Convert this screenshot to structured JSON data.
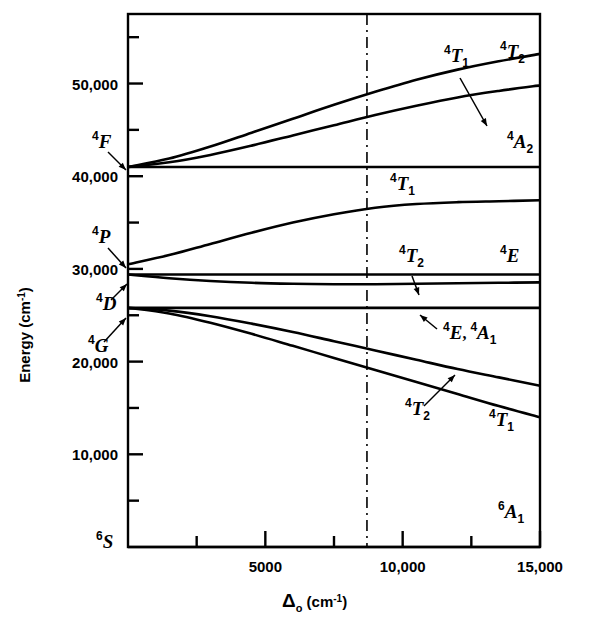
{
  "figure": {
    "kind": "energy-level-diagram",
    "background_color": "#ffffff",
    "line_color": "#000000"
  },
  "axes": {
    "x_label_main": "Δ",
    "x_label_sub": "o",
    "x_label_unit": "(cm",
    "x_label_unit_sup": "-1",
    "x_label_unit_close": ")",
    "y_label_main": "Energy",
    "y_label_unit": "(cm",
    "y_label_unit_sup": "-1",
    "y_label_unit_close": ")",
    "x_ticks_major": [
      "5000",
      "10,000",
      "15,000"
    ],
    "x_tick_values_major": [
      5000,
      10000,
      15000
    ],
    "x_tick_values_minor": [
      2500,
      7500,
      12500
    ],
    "y_ticks_major": [
      "10,000",
      "20,000",
      "30,000",
      "40,000",
      "50,000"
    ],
    "y_tick_values_major": [
      10000,
      20000,
      30000,
      40000,
      50000
    ],
    "y_tick_values_minor": [
      5000,
      15000,
      25000,
      35000,
      45000,
      55000
    ],
    "xlim": [
      0,
      15000
    ],
    "ylim": [
      0,
      57500
    ],
    "marker_line_x": 8700,
    "marker_line_style": "dash-dot"
  },
  "free_ion_terms": [
    {
      "name": "four-F",
      "sup": "4",
      "letter": "F",
      "energy": 41000,
      "label_x": 92,
      "label_y": 148,
      "arrow_from": [
        108,
        152
      ],
      "arrow_to": [
        126,
        170
      ]
    },
    {
      "name": "four-P",
      "sup": "4",
      "letter": "P",
      "energy": 30500,
      "label_x": 92,
      "label_y": 243,
      "arrow_from": [
        108,
        248
      ],
      "arrow_to": [
        126,
        268
      ]
    },
    {
      "name": "four-D",
      "sup": "4",
      "letter": "D",
      "energy": 29300,
      "label_x": 96,
      "label_y": 310,
      "arrow_from": [
        111,
        300
      ],
      "arrow_to": [
        127,
        284
      ]
    },
    {
      "name": "four-G",
      "sup": "4",
      "letter": "G",
      "energy": 25800,
      "label_x": 88,
      "label_y": 352,
      "arrow_from": [
        104,
        342
      ],
      "arrow_to": [
        126,
        318
      ]
    },
    {
      "name": "six-S",
      "sup": "6",
      "letter": "S",
      "energy": 0,
      "label_x": 96,
      "label_y": 548,
      "arrow_from": null,
      "arrow_to": null
    }
  ],
  "chart_data": {
    "type": "line",
    "title": "",
    "xlabel": "Δo (cm-1)",
    "ylabel": "Energy (cm-1)",
    "xlim": [
      0,
      15000
    ],
    "ylim": [
      0,
      57500
    ],
    "grid": false,
    "legend": "inline-labels",
    "x_unit": "cm-1",
    "y_unit": "cm-1",
    "series": [
      {
        "name": "4T2 (from 4F)",
        "label_sup": "4",
        "label_letter": "T",
        "label_sub": "2",
        "points": [
          [
            0,
            41000
          ],
          [
            1500,
            41900
          ],
          [
            3000,
            43200
          ],
          [
            4500,
            44700
          ],
          [
            6000,
            46200
          ],
          [
            7500,
            47700
          ],
          [
            9000,
            49100
          ],
          [
            10500,
            50400
          ],
          [
            12000,
            51500
          ],
          [
            13500,
            52400
          ],
          [
            15000,
            53200
          ]
        ]
      },
      {
        "name": "4A2 (from 4F)",
        "label_sup": "4",
        "label_letter": "A",
        "label_sub": "2",
        "points": [
          [
            0,
            41000
          ],
          [
            1500,
            41500
          ],
          [
            3000,
            42300
          ],
          [
            4500,
            43300
          ],
          [
            6000,
            44400
          ],
          [
            7500,
            45500
          ],
          [
            9000,
            46600
          ],
          [
            10500,
            47600
          ],
          [
            12000,
            48500
          ],
          [
            13500,
            49200
          ],
          [
            15000,
            49800
          ]
        ]
      },
      {
        "name": "4T1 (from 4F)",
        "label_sup": "4",
        "label_letter": "T",
        "label_sub": "1",
        "points": [
          [
            0,
            41000
          ],
          [
            2000,
            41000
          ],
          [
            5000,
            41000
          ],
          [
            9000,
            41000
          ],
          [
            12000,
            41000
          ],
          [
            15000,
            41000
          ]
        ]
      },
      {
        "name": "4T1 (from 4P)",
        "label_sup": "4",
        "label_letter": "T",
        "label_sub": "1",
        "points": [
          [
            0,
            30500
          ],
          [
            1500,
            31500
          ],
          [
            3000,
            32700
          ],
          [
            4500,
            33900
          ],
          [
            6000,
            35000
          ],
          [
            7500,
            35900
          ],
          [
            9000,
            36600
          ],
          [
            10500,
            37000
          ],
          [
            12000,
            37200
          ],
          [
            13500,
            37300
          ],
          [
            15000,
            37400
          ]
        ]
      },
      {
        "name": "4E (from 4D)",
        "label_sup": "4",
        "label_letter": "E",
        "label_sub": "",
        "points": [
          [
            0,
            29400
          ],
          [
            3000,
            29400
          ],
          [
            7000,
            29400
          ],
          [
            11000,
            29400
          ],
          [
            15000,
            29400
          ]
        ]
      },
      {
        "name": "4T2 (from 4D)",
        "label_sup": "4",
        "label_letter": "T",
        "label_sub": "2",
        "points": [
          [
            0,
            29400
          ],
          [
            1500,
            29000
          ],
          [
            3000,
            28700
          ],
          [
            4500,
            28500
          ],
          [
            6000,
            28400
          ],
          [
            7500,
            28350
          ],
          [
            9000,
            28350
          ],
          [
            10500,
            28400
          ],
          [
            12000,
            28450
          ],
          [
            13500,
            28500
          ],
          [
            15000,
            28550
          ]
        ]
      },
      {
        "name": "4E 4A1 (from 4G)",
        "label_sup": "4",
        "label_letter": "E",
        "label_sub": "",
        "label2_sup": "4",
        "label2_letter": "A",
        "label2_sub": "1",
        "label_separator": ",",
        "points": [
          [
            0,
            25800
          ],
          [
            3000,
            25800
          ],
          [
            7000,
            25800
          ],
          [
            11000,
            25800
          ],
          [
            15000,
            25800
          ]
        ]
      },
      {
        "name": "4T2 (from 4G)",
        "label_sup": "4",
        "label_letter": "T",
        "label_sub": "2",
        "points": [
          [
            0,
            25800
          ],
          [
            1500,
            25500
          ],
          [
            3000,
            24900
          ],
          [
            4500,
            24100
          ],
          [
            6000,
            23200
          ],
          [
            7500,
            22200
          ],
          [
            9000,
            21200
          ],
          [
            10500,
            20200
          ],
          [
            12000,
            19200
          ],
          [
            13500,
            18300
          ],
          [
            15000,
            17400
          ]
        ]
      },
      {
        "name": "4T1 (from 4G)",
        "label_sup": "4",
        "label_letter": "T",
        "label_sub": "1",
        "points": [
          [
            0,
            25800
          ],
          [
            1500,
            25200
          ],
          [
            3000,
            24200
          ],
          [
            4500,
            23000
          ],
          [
            6000,
            21700
          ],
          [
            7500,
            20400
          ],
          [
            9000,
            19100
          ],
          [
            10500,
            17800
          ],
          [
            12000,
            16500
          ],
          [
            13500,
            15200
          ],
          [
            15000,
            14000
          ]
        ]
      },
      {
        "name": "6A1 (ground)",
        "label_sup": "6",
        "label_letter": "A",
        "label_sub": "1",
        "points": [
          [
            0,
            0
          ],
          [
            5000,
            0
          ],
          [
            10000,
            0
          ],
          [
            15000,
            0
          ]
        ]
      }
    ]
  },
  "curve_labels": [
    {
      "name": "label-4T2-upper",
      "sup": "4",
      "letter": "T",
      "sub": "2",
      "x": 500,
      "y": 58,
      "arrow": null
    },
    {
      "name": "label-4T1-upper",
      "sup": "4",
      "letter": "T",
      "sub": "1",
      "x": 444,
      "y": 62,
      "arrow": {
        "from": [
          460,
          78
        ],
        "to": [
          487,
          126
        ]
      }
    },
    {
      "name": "label-4A2",
      "sup": "4",
      "letter": "A",
      "sub": "2",
      "x": 507,
      "y": 148,
      "arrow": null
    },
    {
      "name": "label-4T1-P",
      "sup": "4",
      "letter": "T",
      "sub": "1",
      "x": 390,
      "y": 190,
      "arrow": null
    },
    {
      "name": "label-4T2-D",
      "sup": "4",
      "letter": "T",
      "sub": "2",
      "x": 399,
      "y": 262,
      "arrow": {
        "from": [
          412,
          276
        ],
        "to": [
          419,
          295
        ]
      }
    },
    {
      "name": "label-4E-D",
      "sup": "4",
      "letter": "E",
      "sub": "",
      "x": 500,
      "y": 262,
      "arrow": null
    },
    {
      "name": "label-4E-4A1-G",
      "sup": "4",
      "letter": "E",
      "sub": "",
      "sup2": "4",
      "letter2": "A",
      "sub2": "1",
      "sep": ",",
      "x": 443,
      "y": 339,
      "arrow": {
        "from": [
          437,
          329
        ],
        "to": [
          420,
          315
        ]
      }
    },
    {
      "name": "label-4T2-G",
      "sup": "4",
      "letter": "T",
      "sub": "2",
      "x": 405,
      "y": 415,
      "arrow": {
        "from": [
          424,
          406
        ],
        "to": [
          455,
          375
        ]
      }
    },
    {
      "name": "label-4T1-G",
      "sup": "4",
      "letter": "T",
      "sub": "1",
      "x": 489,
      "y": 426,
      "arrow": null
    },
    {
      "name": "label-6A1",
      "sup": "6",
      "letter": "A",
      "sub": "1",
      "x": 498,
      "y": 518,
      "arrow": null
    }
  ]
}
